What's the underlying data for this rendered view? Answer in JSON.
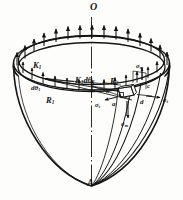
{
  "figure": {
    "axis_top_label": "O",
    "apex_label": "A",
    "labels": {
      "K1_rim": "K",
      "K1_rim_sub": "1",
      "arc_len": "K",
      "arc_len_sub": "1",
      "arc_len_d": "d",
      "arc_len_theta": "θ",
      "arc_len_theta_sub": "1",
      "dtheta_left_d": "d",
      "dtheta_left_theta": "θ",
      "dtheta_left_sub": "1",
      "R1": "R",
      "R1_sub": "1",
      "R2": "R",
      "R2_sub": "2",
      "elem_a": "a",
      "elem_b": "b",
      "elem_c": "c",
      "elem_d": "d",
      "sigma_m_top": "σ",
      "sigma_m_top_sub": "m",
      "sigma_m_bottom": "σ",
      "sigma_m_bottom_sub": "m",
      "sigma_t_left": "σ",
      "sigma_t_left_sub": "t",
      "sigma_t_right": "σ",
      "sigma_t_right_sub": "t"
    },
    "colors": {
      "ink": "#141414",
      "paper": "#fdfdfb",
      "hairline": "#2a2a2a"
    },
    "load_arrows": {
      "count": 28,
      "direction": "up",
      "description": "uniform distributed upward load around the rim ring"
    },
    "geometry": {
      "shell_type": "paraboloid of revolution",
      "rim": "elliptical ring band (double ellipse)",
      "meridian_count": 4,
      "element": "differential element abcd on the meridian"
    }
  }
}
